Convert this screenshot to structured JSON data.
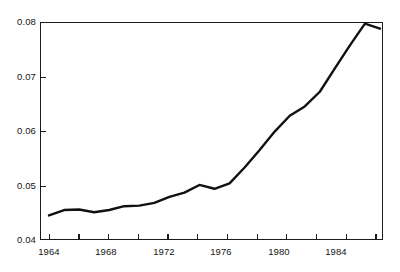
{
  "figure": {
    "background": "#ffffff",
    "line_color": "#111111",
    "axis_color": "#1b1b1b"
  },
  "chart_data": {
    "type": "line",
    "title": "",
    "subtitle": "",
    "xlabel": "",
    "ylabel": "",
    "xlim": [
      1963.4,
      1986.2
    ],
    "ylim": [
      0.04,
      0.08
    ],
    "grid": false,
    "legend": null,
    "legend_position": null,
    "annotations": [],
    "x_ticks_major": [
      1964,
      1968,
      1972,
      1976,
      1980,
      1984
    ],
    "x_ticks_minor": [
      1966,
      1970,
      1974,
      1978,
      1982,
      1986
    ],
    "x_tick_labels": [
      "1964",
      "1968",
      "1972",
      "1976",
      "1980",
      "1984"
    ],
    "y_ticks": [
      0.04,
      0.05,
      0.06,
      0.07,
      0.08
    ],
    "y_tick_labels": [
      "0.04",
      "0.05",
      "0.06",
      "0.07",
      "0.08"
    ],
    "series": [
      {
        "name": "series-1",
        "x": [
          1964,
          1965,
          1966,
          1967,
          1968,
          1969,
          1970,
          1971,
          1972,
          1973,
          1974,
          1975,
          1976,
          1977,
          1978,
          1979,
          1980,
          1981,
          1982,
          1983,
          1984,
          1985,
          1986
        ],
        "values": [
          0.0445,
          0.0455,
          0.0456,
          0.0451,
          0.0455,
          0.0462,
          0.0463,
          0.0468,
          0.0479,
          0.0487,
          0.0501,
          0.0494,
          0.0504,
          0.0533,
          0.0565,
          0.0599,
          0.0628,
          0.0645,
          0.0672,
          0.0715,
          0.0757,
          0.0797,
          0.0788
        ]
      }
    ]
  }
}
